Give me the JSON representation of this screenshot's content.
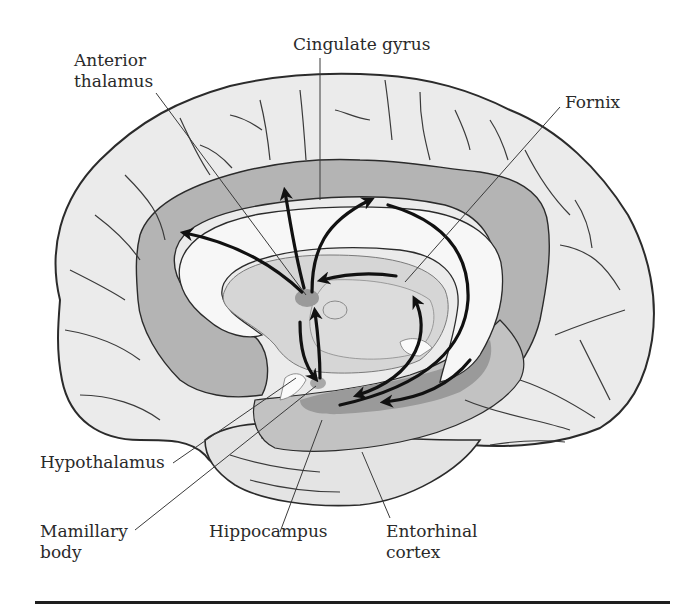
{
  "figure": {
    "colors": {
      "background": "#ffffff",
      "cortex_light": "#ebebeb",
      "limbic_mid": "#b4b4b4",
      "limbic_dark": "#9a9a9a",
      "white_matter": "#f7f7f7",
      "thalamus_region": "#d6d6d6",
      "outline": "#2b2b2b",
      "arrow": "#111111",
      "label_text": "#2a2a2a",
      "rule": "#1e1e1e"
    },
    "labels": {
      "anterior_thalamus": {
        "line1": "Anterior",
        "line2": "thalamus"
      },
      "cingulate_gyrus": {
        "line1": "Cingulate gyrus"
      },
      "fornix": {
        "line1": "Fornix"
      },
      "hypothalamus": {
        "line1": "Hypothalamus"
      },
      "mamillary_body": {
        "line1": "Mamillary",
        "line2": "body"
      },
      "hippocampus": {
        "line1": "Hippocampus"
      },
      "entorhinal_cortex": {
        "line1": "Entorhinal",
        "line2": "cortex"
      }
    }
  }
}
